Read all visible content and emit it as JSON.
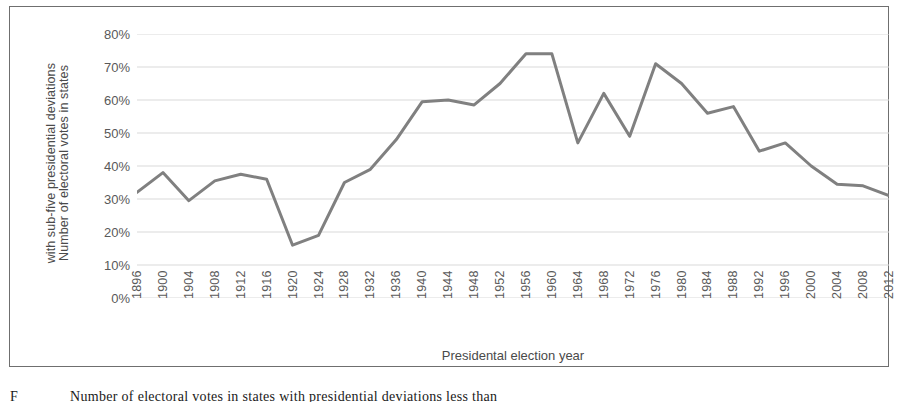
{
  "figure": {
    "caption": "Number of electoral votes in states with presidential deviations less than",
    "caption_prefix": "F"
  },
  "axes": {
    "y_title_line1": "Number of electoral votes in states",
    "y_title_line2": "with sub-five presidential deviations",
    "x_title": "Presidental election year",
    "y_ticks": [
      "0%",
      "10%",
      "20%",
      "30%",
      "40%",
      "50%",
      "60%",
      "70%",
      "80%"
    ],
    "y_min": 0,
    "y_max": 80,
    "grid": "horizontal",
    "line_color": "#808080",
    "grid_color": "#d9d9d9",
    "frame_color": "#6f6f6f"
  },
  "chart_data": {
    "type": "line",
    "title": "",
    "xlabel": "Presidental election year",
    "ylabel": "Number of electoral votes in states with sub-five presidential deviations",
    "ylim": [
      0,
      80
    ],
    "ytick_labels": [
      "0%",
      "10%",
      "20%",
      "30%",
      "40%",
      "50%",
      "60%",
      "70%",
      "80%"
    ],
    "ytick_values": [
      0,
      10,
      20,
      30,
      40,
      50,
      60,
      70,
      80
    ],
    "grid": true,
    "legend": "none",
    "units": "percent",
    "categories": [
      "1896",
      "1900",
      "1904",
      "1908",
      "1912",
      "1916",
      "1920",
      "1924",
      "1928",
      "1932",
      "1936",
      "1940",
      "1944",
      "1948",
      "1952",
      "1956",
      "1960",
      "1964",
      "1968",
      "1972",
      "1976",
      "1980",
      "1984",
      "1988",
      "1992",
      "1996",
      "2000",
      "2004",
      "2008",
      "2012"
    ],
    "series": [
      {
        "name": "Electoral votes in low-deviation states",
        "color": "#808080",
        "values": [
          32,
          38,
          29.5,
          35.5,
          37.5,
          36,
          16,
          19,
          35,
          39,
          48,
          59.5,
          60,
          58.5,
          65,
          74,
          74,
          47,
          62,
          49,
          71,
          65,
          56,
          58,
          44.5,
          47,
          40,
          34.5,
          34,
          31
        ]
      }
    ]
  }
}
